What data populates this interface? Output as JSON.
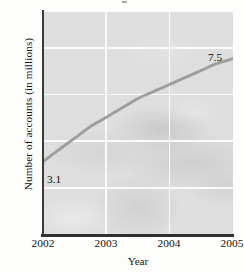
{
  "chart_data": {
    "type": "line",
    "title": "",
    "xlabel": "Year",
    "ylabel": "Number of accounts (in millions)",
    "x": [
      2002,
      2003,
      2004,
      2005
    ],
    "values": [
      3.1,
      5.0,
      6.4,
      7.5
    ],
    "series": [
      {
        "name": "Number of accounts",
        "points": [
          {
            "x": 2002,
            "y": 3.1
          },
          {
            "x": 2002.25,
            "y": 3.6
          },
          {
            "x": 2002.5,
            "y": 4.1
          },
          {
            "x": 2002.75,
            "y": 4.6
          },
          {
            "x": 2003,
            "y": 5.0
          },
          {
            "x": 2003.25,
            "y": 5.4
          },
          {
            "x": 2003.5,
            "y": 5.8
          },
          {
            "x": 2003.75,
            "y": 6.1
          },
          {
            "x": 2004,
            "y": 6.4
          },
          {
            "x": 2004.25,
            "y": 6.7
          },
          {
            "x": 2004.5,
            "y": 7.0
          },
          {
            "x": 2004.75,
            "y": 7.3
          },
          {
            "x": 2005,
            "y": 7.5
          }
        ]
      }
    ],
    "xticklabels": [
      "2002",
      "2003",
      "2004",
      "2005"
    ],
    "yticklabels": [
      "0",
      "2",
      "4",
      "6",
      "8"
    ],
    "yticks": [
      0,
      2,
      4,
      6,
      8
    ],
    "xlim": [
      2002,
      2005
    ],
    "ylim": [
      0,
      9.5
    ],
    "grid": true,
    "legend": "none",
    "annotations": [
      {
        "text": "3.1",
        "x": 2002,
        "y": 3.1,
        "position": "below-right"
      },
      {
        "text": "7.5",
        "x": 2005,
        "y": 7.5,
        "position": "above-left"
      }
    ],
    "colors": {
      "line": "#9a9a9a",
      "plot_background": "#dedede",
      "gridline": "#fafafa",
      "axis": "#333333",
      "text": "#141414"
    }
  }
}
